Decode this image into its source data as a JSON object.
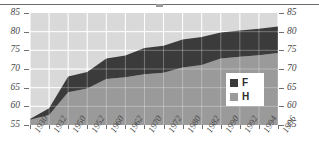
{
  "chart_data": {
    "type": "area",
    "title": "",
    "subtitle": "",
    "xlabel": "",
    "ylabel": "",
    "ylim": [
      55,
      85
    ],
    "grid": true,
    "stacked": false,
    "legend_position": "inside-bottom-right",
    "y_ticks": [
      85,
      80,
      75,
      70,
      65,
      60,
      55
    ],
    "y_ticks_right": [
      85,
      80,
      75,
      70,
      65,
      60,
      55
    ],
    "categories": [
      "1930",
      "1932",
      "1950",
      "1952",
      "1960",
      "1962",
      "1970",
      "1972",
      "1980",
      "1982",
      "1990",
      "1992",
      "1994",
      "1996"
    ],
    "series": [
      {
        "name": "F",
        "color": "#3b3b3b",
        "values": [
          56.6,
          59.5,
          68.0,
          69.2,
          72.8,
          73.6,
          75.6,
          76.2,
          77.9,
          78.6,
          79.8,
          80.3,
          80.8,
          81.4
        ]
      },
      {
        "name": "H",
        "color": "#9a9a9a",
        "values": [
          56.4,
          57.7,
          63.8,
          64.8,
          67.3,
          67.8,
          68.6,
          69.0,
          70.4,
          71.1,
          72.8,
          73.3,
          73.7,
          74.3
        ]
      }
    ],
    "annotations": []
  },
  "legend": {
    "entries": [
      {
        "label": "F",
        "swatch": "#3b3b3b"
      },
      {
        "label": "H",
        "swatch": "#9a9a9a"
      }
    ]
  },
  "colors": {
    "plot_background": "#d9d9d9",
    "gridline": "#ffffff",
    "axis": "#6f6f6f",
    "tick_text": "#4a4a4a",
    "rule": "#6b6b6b",
    "legend_background": "#ffffff",
    "band_upper": "#3b3b3b",
    "band_lower": "#9a9a9a"
  },
  "icons": {
    "legend_swatch_f": "filled-square-dark-icon",
    "legend_swatch_h": "filled-square-gray-icon"
  }
}
